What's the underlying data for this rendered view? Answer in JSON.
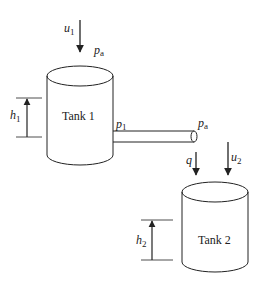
{
  "diagram": {
    "tank1": {
      "label": "Tank 1",
      "level_label": "h",
      "level_sub": "1"
    },
    "tank2": {
      "label": "Tank 2",
      "level_label": "h",
      "level_sub": "2"
    },
    "inputs": {
      "u1": {
        "label": "u",
        "sub": "1"
      },
      "u2": {
        "label": "u",
        "sub": "2"
      },
      "q": {
        "label": "q"
      }
    },
    "pressures": {
      "pa_top": {
        "label": "p",
        "sub": "a"
      },
      "p1": {
        "label": "p",
        "sub": "1"
      },
      "pa_pipe": {
        "label": "p",
        "sub": "a"
      }
    },
    "colors": {
      "stroke": "#222222",
      "background": "#ffffff"
    }
  }
}
